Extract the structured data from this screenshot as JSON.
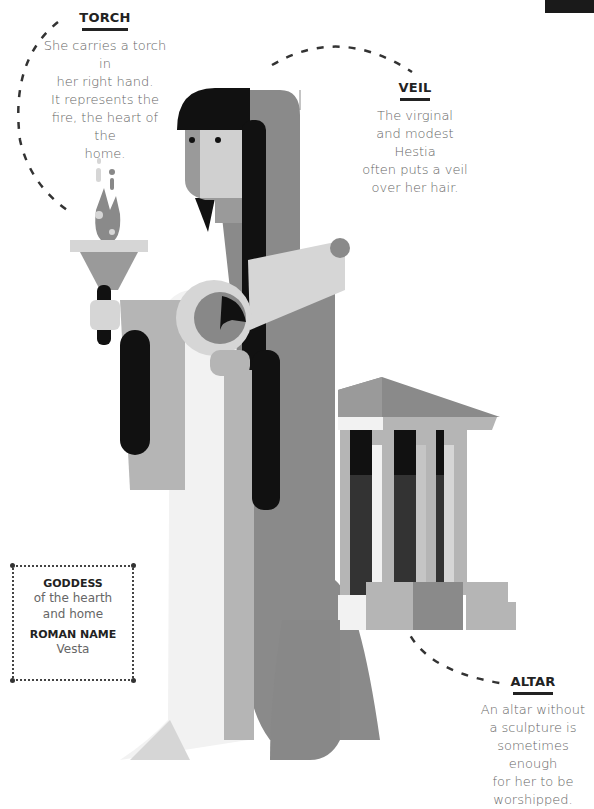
{
  "annotations": {
    "torch": {
      "title": "TORCH",
      "lines": [
        "She carries a torch in",
        "her right hand.",
        "It represents the",
        "fire, the heart of the",
        "home."
      ]
    },
    "veil": {
      "title": "VEIL",
      "lines": [
        "The virginal",
        "and modest Hestia",
        "often puts a veil",
        "over her hair."
      ]
    },
    "altar": {
      "title": "ALTAR",
      "lines": [
        "An altar without",
        "a sculpture is",
        "sometimes enough",
        "for her to be",
        "worshipped."
      ]
    }
  },
  "info_box": {
    "goddess_label": "GODDESS",
    "goddess_lines": [
      "of the hearth",
      "and home"
    ],
    "roman_label": "ROMAN NAME",
    "roman_value": "Vesta"
  },
  "colors": {
    "black": "#111111",
    "dark_grey": "#555555",
    "mid_grey": "#888888",
    "light_grey": "#b5b5b5",
    "pale_grey": "#d6d6d6",
    "off_white": "#f2f2f2"
  }
}
